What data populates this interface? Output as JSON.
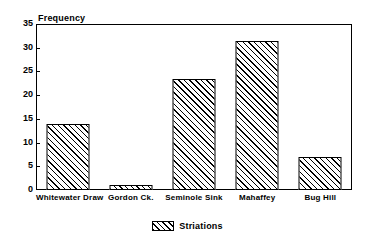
{
  "chart_data": {
    "type": "bar",
    "title": "",
    "subtitle": "",
    "xlabel": "",
    "ylabel": "Frequency",
    "ylim": [
      0,
      35
    ],
    "yticks": [
      0,
      5,
      10,
      15,
      20,
      25,
      30,
      35
    ],
    "grid": false,
    "legend_position": "bottom",
    "categories": [
      "Whitewater Draw",
      "Gordon Ck.",
      "Seminole Sink",
      "Mahaffey",
      "Bug Hill"
    ],
    "series": [
      {
        "name": "Striations",
        "values": [
          14,
          1,
          23.5,
          31.5,
          7
        ]
      }
    ],
    "bar_fill": "diagonal-hatch",
    "colors": {
      "axis": "#000000",
      "bar_outline": "#000000",
      "bar_hatch": "#000000",
      "background": "#ffffff"
    }
  }
}
